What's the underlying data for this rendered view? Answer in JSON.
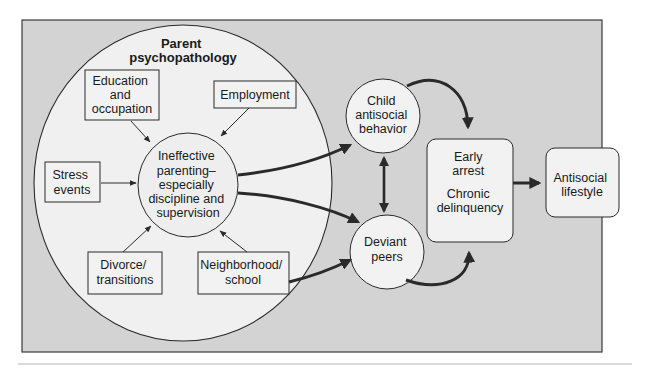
{
  "diagram": {
    "colors": {
      "panel_bg": "#d3d3d3",
      "panel_border": "#3a3a3a",
      "node_fill": "#f2f2f2",
      "outer_circle_fill": "#f0f0f0",
      "stroke": "#2a2a2a",
      "rule_line": "#cfcfcf"
    },
    "outer_circle": {
      "title_line1": "Parent",
      "title_line2": "psychopathology"
    },
    "nodes": {
      "education": {
        "line1": "Education",
        "line2": "and",
        "line3": "occupation"
      },
      "employment": {
        "line1": "Employment"
      },
      "stress": {
        "line1": "Stress",
        "line2": "events"
      },
      "parenting": {
        "line1": "Ineffective",
        "line2": "parenting–",
        "line3": "especially",
        "line4": "discipline and",
        "line5": "supervision"
      },
      "divorce": {
        "line1": "Divorce/",
        "line2": "transitions"
      },
      "neighborhood": {
        "line1": "Neighborhood/",
        "line2": "school"
      },
      "child_antisocial": {
        "line1": "Child",
        "line2": "antisocial",
        "line3": "behavior"
      },
      "deviant_peers": {
        "line1": "Deviant",
        "line2": "peers"
      },
      "early_arrest": {
        "line1": "Early",
        "line2": "arrest",
        "line3": "Chronic",
        "line4": "delinquency"
      },
      "antisocial_lifestyle": {
        "line1": "Antisocial",
        "line2": "lifestyle"
      }
    },
    "edges": [
      {
        "from": "education",
        "to": "parenting",
        "weight": "thin"
      },
      {
        "from": "employment",
        "to": "parenting",
        "weight": "thin"
      },
      {
        "from": "stress",
        "to": "parenting",
        "weight": "thin"
      },
      {
        "from": "divorce",
        "to": "parenting",
        "weight": "thin"
      },
      {
        "from": "neighborhood",
        "to": "parenting",
        "weight": "thin"
      },
      {
        "from": "parenting",
        "to": "child_antisocial",
        "weight": "thick"
      },
      {
        "from": "parenting",
        "to": "deviant_peers",
        "weight": "thick"
      },
      {
        "from": "neighborhood",
        "to": "deviant_peers",
        "weight": "thick"
      },
      {
        "from": "child_antisocial",
        "to": "deviant_peers",
        "weight": "thick",
        "bidirectional": true
      },
      {
        "from": "child_antisocial",
        "to": "early_arrest",
        "weight": "thick"
      },
      {
        "from": "deviant_peers",
        "to": "early_arrest",
        "weight": "thick"
      },
      {
        "from": "early_arrest",
        "to": "antisocial_lifestyle",
        "weight": "thick"
      }
    ]
  }
}
